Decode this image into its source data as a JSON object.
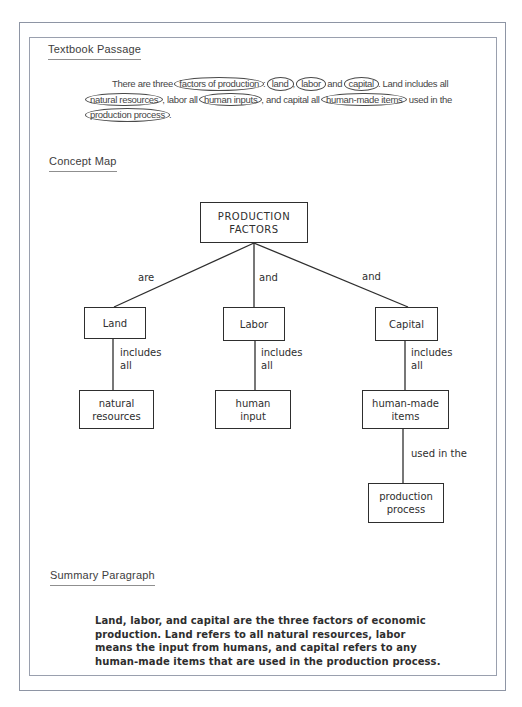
{
  "colors": {
    "frame": "#8e95a4",
    "ink": "#2e2e2e",
    "passage_text": "#454545"
  },
  "sections": {
    "textbook_passage": {
      "heading": "Textbook Passage"
    },
    "concept_map": {
      "heading": "Concept Map"
    },
    "summary": {
      "heading": "Summary Paragraph",
      "lines": [
        "Land, labor, and capital are the three factors of economic",
        "production. Land refers to all natural resources, labor",
        "means the input from humans, and capital refers to any",
        "human-made items that are used in the production process."
      ]
    }
  },
  "passage": {
    "lines": [
      [
        "There are three ",
        "factors of production",
        ": ",
        "land",
        ", ",
        "labor",
        " and ",
        "capital",
        ". Land includes all"
      ],
      [
        "natural resources",
        ", labor all ",
        "human inputs",
        ", and capital all ",
        "human-made items",
        " used in the"
      ],
      [
        "production process",
        "."
      ]
    ]
  },
  "concept_map": {
    "nodes": {
      "root": "PRODUCTION\nFACTORS",
      "land": "Land",
      "labor": "Labor",
      "capital": "Capital",
      "natural_resources": "natural\nresources",
      "human_input": "human\ninput",
      "human_made_items": "human-made\nitems",
      "production_process": "production\nprocess"
    },
    "edge_labels": {
      "are": "are",
      "and_mid": "and",
      "and_right": "and",
      "includes_all_1": "includes\nall",
      "includes_all_2": "includes\nall",
      "includes_all_3": "includes\nall",
      "used_in_the": "used in the"
    }
  }
}
